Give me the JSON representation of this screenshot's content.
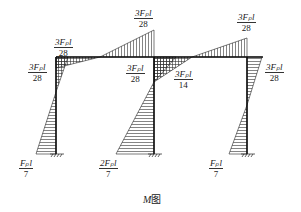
{
  "diagram": {
    "title": "M图",
    "caption_var": "M",
    "caption_suffix": "图",
    "type": "bending-moment-diagram",
    "labels": [
      {
        "id": "beam-left-top",
        "num": "3Fₚl",
        "den": "28"
      },
      {
        "id": "col1-top-left",
        "num": "3Fₚl",
        "den": "28"
      },
      {
        "id": "beam-mid-top",
        "num": "3Fₚl",
        "den": "28"
      },
      {
        "id": "beam-mid-bottom",
        "num": "3Fₚl",
        "den": "28"
      },
      {
        "id": "col2-top-right",
        "num": "3Fₚl",
        "den": "14"
      },
      {
        "id": "beam-right-top",
        "num": "3Fₚl",
        "den": "28"
      },
      {
        "id": "col3-top-right",
        "num": "3Fₚl",
        "den": "28"
      },
      {
        "id": "col1-base",
        "num": "Fₚl",
        "den": "7"
      },
      {
        "id": "col2-base",
        "num": "2Fₚl",
        "den": "7"
      },
      {
        "id": "col3-base",
        "num": "Fₚl",
        "den": "7"
      }
    ]
  }
}
